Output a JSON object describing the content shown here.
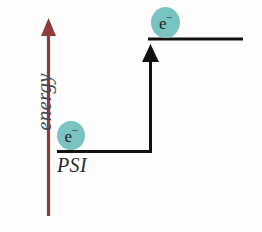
{
  "diagram": {
    "background_color": "#fefefe",
    "axis": {
      "label": "energy",
      "label_color": "#4a4a4a",
      "arrow_color": "#8e3b3b",
      "direction": "up"
    },
    "levels": [
      {
        "id": "ground",
        "caption": "PSI",
        "caption_color": "#2a2a2a",
        "line_color": "#111111",
        "energy": "low"
      },
      {
        "id": "excited",
        "caption": "",
        "line_color": "#111111",
        "energy": "high"
      }
    ],
    "electrons": [
      {
        "id": "electron-ground",
        "symbol": "e",
        "charge": "–",
        "fill_color": "#79c3c2",
        "text_color": "#1d1d1d",
        "level": "ground"
      },
      {
        "id": "electron-excited",
        "symbol": "e",
        "charge": "–",
        "fill_color": "#79c3c2",
        "text_color": "#1d1d1d",
        "level": "excited"
      }
    ],
    "transition": {
      "label": "",
      "color": "#111111",
      "from_level": "ground",
      "to_level": "excited",
      "direction": "up"
    }
  }
}
